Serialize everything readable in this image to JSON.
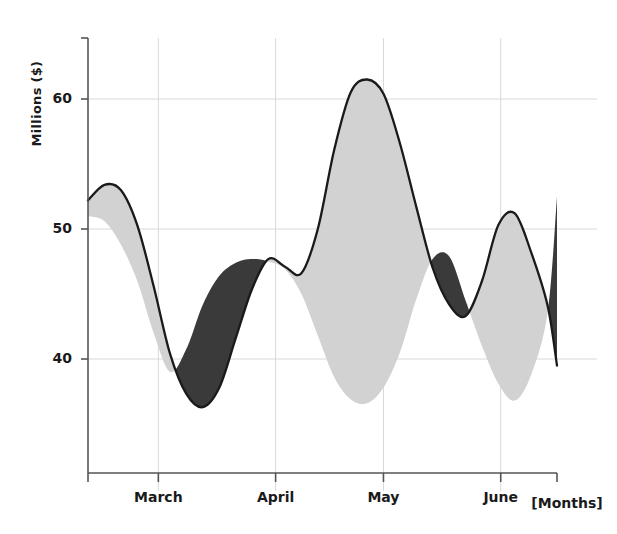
{
  "chart_data": {
    "type": "area",
    "title": "",
    "subtitle": "",
    "xlabel": "[Months]",
    "ylabel": "Millions ($)",
    "grid": true,
    "legend_position": "none",
    "xlim": [
      0,
      10
    ],
    "ylim": [
      34,
      64
    ],
    "yticks": [
      40,
      50,
      60
    ],
    "ytick_labels": [
      "40",
      "50",
      "60"
    ],
    "xticks": [
      0,
      1.5,
      4.0,
      6.3,
      8.8
    ],
    "xtick_labels": [
      "",
      "March",
      "April",
      "May",
      "June"
    ],
    "x_axis_end_label": "[Months]",
    "colors": {
      "above_fill": "#d2d2d2",
      "below_fill": "#3a3a3a",
      "line": "#1a1a1a",
      "axis": "#555555",
      "grid": "#d8d8d8",
      "background": "#ffffff"
    },
    "series": [
      {
        "name": "series-a",
        "role": "outlined-curve",
        "x": [
          0.0,
          0.35,
          0.7,
          1.05,
          1.4,
          1.75,
          2.1,
          2.45,
          2.8,
          3.15,
          3.5,
          3.85,
          4.2,
          4.55,
          4.9,
          5.25,
          5.6,
          5.95,
          6.3,
          6.65,
          7.0,
          7.35,
          7.7,
          8.05,
          8.4,
          8.75,
          9.1,
          9.45,
          9.8,
          10.0
        ],
        "values": [
          52.2,
          53.4,
          53.0,
          50.3,
          45.6,
          40.4,
          37.3,
          36.3,
          37.8,
          41.6,
          45.4,
          47.7,
          47.1,
          46.6,
          50.0,
          56.1,
          60.5,
          61.5,
          60.4,
          56.6,
          51.7,
          47.0,
          44.2,
          43.3,
          46.0,
          50.3,
          51.2,
          48.2,
          44.1,
          39.5
        ]
      },
      {
        "name": "series-b",
        "role": "fill-boundary",
        "x": [
          0.0,
          0.35,
          0.7,
          1.05,
          1.4,
          1.75,
          2.1,
          2.45,
          2.8,
          3.15,
          3.5,
          3.85,
          4.2,
          4.55,
          4.9,
          5.25,
          5.6,
          5.95,
          6.3,
          6.65,
          7.0,
          7.35,
          7.7,
          8.05,
          8.4,
          8.75,
          9.1,
          9.45,
          9.8,
          10.0
        ],
        "values": [
          51.0,
          50.6,
          48.8,
          46.0,
          42.0,
          39.0,
          40.8,
          44.2,
          46.4,
          47.4,
          47.7,
          47.5,
          46.9,
          45.0,
          41.8,
          38.6,
          36.9,
          36.6,
          37.8,
          40.5,
          44.6,
          47.7,
          47.9,
          44.5,
          41.0,
          38.1,
          36.8,
          38.8,
          43.6,
          52.5
        ]
      }
    ],
    "annotations": []
  }
}
